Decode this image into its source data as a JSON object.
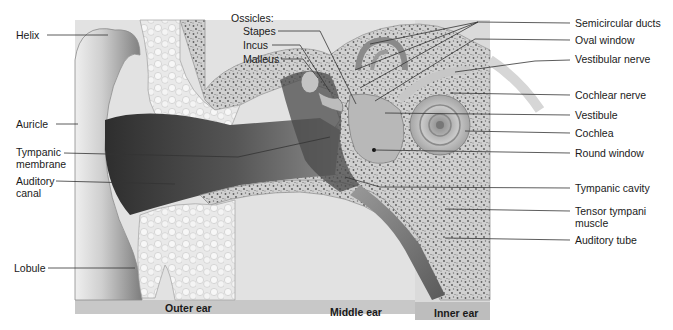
{
  "figure": {
    "sections": [
      {
        "id": "outer",
        "label": "Outer ear",
        "x": 165,
        "y": 305
      },
      {
        "id": "middle",
        "label": "Middle ear",
        "x": 330,
        "y": 309
      },
      {
        "id": "inner",
        "label": "Inner ear",
        "x": 434,
        "y": 310
      }
    ],
    "labels_left": [
      {
        "id": "helix",
        "text": "Helix",
        "x": 16,
        "y": 29,
        "line": [
          [
            47,
            35
          ],
          [
            108,
            35
          ]
        ]
      },
      {
        "id": "auricle",
        "text": "Auricle",
        "x": 16,
        "y": 118,
        "line": [
          [
            56,
            124
          ],
          [
            78,
            124
          ]
        ]
      },
      {
        "id": "tympanic-membrane",
        "text": "Tympanic\nmembrane",
        "x": 16,
        "y": 146,
        "line": [
          [
            64,
            153
          ],
          [
            238,
            157
          ],
          [
            330,
            137
          ]
        ]
      },
      {
        "id": "auditory-canal",
        "text": "Auditory\ncanal",
        "x": 16,
        "y": 175,
        "line": [
          [
            56,
            181
          ],
          [
            175,
            184
          ]
        ]
      },
      {
        "id": "lobule",
        "text": "Lobule",
        "x": 14,
        "y": 262,
        "line": [
          [
            48,
            268
          ],
          [
            135,
            268
          ]
        ]
      }
    ],
    "ossicles": {
      "heading": "Ossicles:",
      "heading_pos": {
        "x": 231,
        "y": 12
      },
      "items": [
        {
          "id": "stapes",
          "text": "Stapes",
          "x": 243,
          "y": 25,
          "line": [
            [
              278,
              31
            ],
            [
              320,
              31
            ],
            [
              356,
              104
            ]
          ]
        },
        {
          "id": "incus",
          "text": "Incus",
          "x": 243,
          "y": 39,
          "line": [
            [
              272,
              45
            ],
            [
              300,
              45
            ],
            [
              330,
              92
            ]
          ]
        },
        {
          "id": "malleus",
          "text": "Malleus",
          "x": 243,
          "y": 53,
          "line": [
            [
              281,
              59
            ],
            [
              303,
              59
            ],
            [
              318,
              78
            ]
          ]
        }
      ]
    },
    "labels_right": [
      {
        "id": "semicircular-ducts",
        "text": "Semicircular ducts",
        "x": 575,
        "y": 17,
        "lines": [
          [
            [
              570,
              23
            ],
            [
              478,
              22
            ],
            [
              370,
              44
            ]
          ],
          [
            [
              478,
              22
            ],
            [
              355,
              70
            ]
          ],
          [
            [
              478,
              22
            ],
            [
              360,
              88
            ]
          ]
        ]
      },
      {
        "id": "oval-window",
        "text": "Oval window",
        "x": 575,
        "y": 34,
        "lines": [
          [
            [
              570,
              40
            ],
            [
              475,
              39
            ],
            [
              375,
              101
            ]
          ]
        ]
      },
      {
        "id": "vestibular-nerve",
        "text": "Vestibular nerve",
        "x": 575,
        "y": 53,
        "lines": [
          [
            [
              570,
              60
            ],
            [
              535,
              61
            ],
            [
              455,
              72
            ]
          ]
        ]
      },
      {
        "id": "cochlear-nerve",
        "text": "Cochlear nerve",
        "x": 575,
        "y": 89,
        "lines": [
          [
            [
              570,
              95
            ],
            [
              450,
              93
            ]
          ]
        ]
      },
      {
        "id": "vestibule",
        "text": "Vestibule",
        "x": 575,
        "y": 109,
        "lines": [
          [
            [
              570,
              115
            ],
            [
              385,
              113
            ]
          ]
        ]
      },
      {
        "id": "cochlea",
        "text": "Cochlea",
        "x": 575,
        "y": 127,
        "lines": [
          [
            [
              570,
              133
            ],
            [
              465,
              131
            ]
          ]
        ]
      },
      {
        "id": "round-window",
        "text": "Round window",
        "x": 575,
        "y": 147,
        "lines": [
          [
            [
              570,
              153
            ],
            [
              374,
              150
            ]
          ]
        ]
      },
      {
        "id": "tympanic-cavity",
        "text": "Tympanic cavity",
        "x": 575,
        "y": 182,
        "lines": [
          [
            [
              570,
              188
            ],
            [
              380,
              187
            ],
            [
              345,
              177
            ]
          ]
        ]
      },
      {
        "id": "tensor-tympani-muscle",
        "text": "Tensor tympani\nmuscle",
        "x": 575,
        "y": 205,
        "lines": [
          [
            [
              570,
              211
            ],
            [
              445,
              209
            ]
          ]
        ]
      },
      {
        "id": "auditory-tube",
        "text": "Auditory tube",
        "x": 575,
        "y": 234,
        "lines": [
          [
            [
              570,
              240
            ],
            [
              445,
              238
            ]
          ]
        ]
      }
    ],
    "colors": {
      "background": "#ffffff",
      "bottom_band": "#c8c8c8",
      "inner_band": "#bdbdbd",
      "panel": "#e2e2e2",
      "bone": "#c9c9c9",
      "bone_speckle": "#6a6a6a",
      "canal_dark": "#3c3c3c",
      "leader": "#333333",
      "text": "#1a1a1a"
    }
  }
}
